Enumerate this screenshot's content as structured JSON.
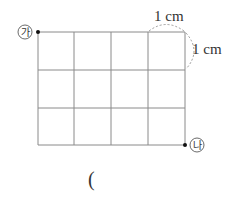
{
  "diagram": {
    "grid": {
      "cols": 4,
      "rows": 3,
      "unit": "1 cm",
      "line_color": "#8a8a8a"
    },
    "point_a": {
      "label": "㉮"
    },
    "point_b": {
      "label": "㉯"
    },
    "unit_top": "1 cm",
    "unit_right": "1 cm",
    "answer_paren": "("
  }
}
